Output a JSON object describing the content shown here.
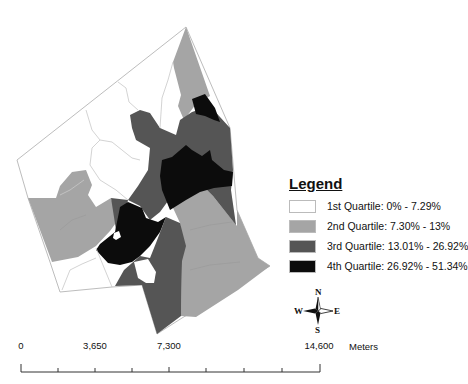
{
  "map": {
    "colors": {
      "q1": "#ffffff",
      "q2": "#a5a5a5",
      "q3": "#555555",
      "q4": "#0c0c0c",
      "boundary": "#bdbdbd"
    }
  },
  "legend": {
    "title": "Legend",
    "items": [
      {
        "label": "1st Quartile: 0% - 7.29%",
        "color": "#ffffff"
      },
      {
        "label": "2nd Quartile: 7.30% - 13%",
        "color": "#a5a5a5"
      },
      {
        "label": "3rd Quartile: 13.01% - 26.92%",
        "color": "#555555"
      },
      {
        "label": "4th Quartile: 26.92% - 51.34%",
        "color": "#0c0c0c"
      }
    ]
  },
  "compass": {
    "n": "N",
    "s": "S",
    "e": "E",
    "w": "W"
  },
  "scale_bar": {
    "labels": [
      "0",
      "3,650",
      "7,300",
      "14,600"
    ],
    "units": "Meters"
  }
}
